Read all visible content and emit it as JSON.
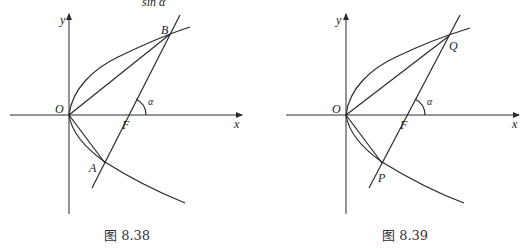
{
  "header_fragment": "sin α",
  "figures": [
    {
      "caption": "图 8.38",
      "labels": {
        "y_axis": "y",
        "x_axis": "x",
        "origin": "O",
        "focus": "F",
        "upper_point": "B",
        "lower_point": "A",
        "angle": "α"
      }
    },
    {
      "caption": "图 8.39",
      "labels": {
        "y_axis": "y",
        "x_axis": "x",
        "origin": "O",
        "focus": "F",
        "upper_point": "Q",
        "lower_point": "P",
        "angle": "α"
      }
    }
  ]
}
